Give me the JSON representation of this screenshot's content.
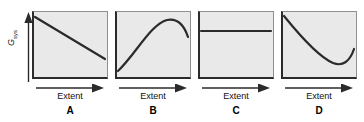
{
  "figure": {
    "y_axis": {
      "label_main": "G",
      "label_sub": "sys",
      "arrow_icon": "arrow-up-icon"
    },
    "panels": [
      {
        "letter": "A",
        "x_axis_label": "Extent",
        "x_arrow_icon": "arrow-right-icon",
        "curve_name": "monotonic-decreasing-line",
        "curve_path": "M 3 6 L 73 48"
      },
      {
        "letter": "B",
        "x_axis_label": "Extent",
        "x_arrow_icon": "arrow-right-icon",
        "curve_name": "rising-curve-with-maximum",
        "curve_path": "M 3 60 C 20 44 36 13 52 9 C 62 7 69 14 73 26"
      },
      {
        "letter": "C",
        "x_axis_label": "Extent",
        "x_arrow_icon": "arrow-right-icon",
        "curve_name": "horizontal-constant-line",
        "curve_path": "M 3 20 L 73 20"
      },
      {
        "letter": "D",
        "x_axis_label": "Extent",
        "x_arrow_icon": "arrow-right-icon",
        "curve_name": "descending-curve-with-minimum",
        "curve_path": "M 3 5 C 20 26 38 46 52 52 C 62 56 69 50 73 38"
      }
    ]
  },
  "chart_data": {
    "type": "line",
    "title": "",
    "xlabel": "Extent",
    "ylabel": "G_sys",
    "grid": false,
    "legend": false,
    "axis_ticks": false,
    "panel_count": 4,
    "panels": [
      {
        "label": "A",
        "description": "Gibbs energy decreases linearly as extent of reaction increases; no minimum within range.",
        "shape": "linear-decreasing",
        "x": [
          0,
          0.25,
          0.5,
          0.75,
          1.0
        ],
        "y": [
          0.91,
          0.775,
          0.64,
          0.505,
          0.37
        ]
      },
      {
        "label": "B",
        "description": "Gibbs energy increases, reaches a maximum near high extent, then decreases.",
        "shape": "concave-down-with-maximum",
        "x": [
          0,
          0.25,
          0.5,
          0.7,
          0.85,
          1.0
        ],
        "y": [
          0.12,
          0.45,
          0.73,
          0.86,
          0.87,
          0.62
        ]
      },
      {
        "label": "C",
        "description": "Gibbs energy remains constant as extent of reaction increases.",
        "shape": "constant-horizontal",
        "x": [
          0,
          0.25,
          0.5,
          0.75,
          1.0
        ],
        "y": [
          0.71,
          0.71,
          0.71,
          0.71,
          0.71
        ]
      },
      {
        "label": "D",
        "description": "Gibbs energy decreases to a minimum then rises; equilibrium at the minimum.",
        "shape": "concave-up-with-minimum",
        "x": [
          0,
          0.25,
          0.5,
          0.7,
          0.85,
          1.0
        ],
        "y": [
          0.93,
          0.63,
          0.33,
          0.22,
          0.22,
          0.44
        ]
      }
    ],
    "xlim": [
      0,
      1
    ],
    "ylim": [
      0,
      1
    ],
    "colors": {
      "curve": "#2b2b2b",
      "panel_background": "#e9e9e9",
      "axis": "#2b2b2b",
      "text": "#111111"
    }
  }
}
